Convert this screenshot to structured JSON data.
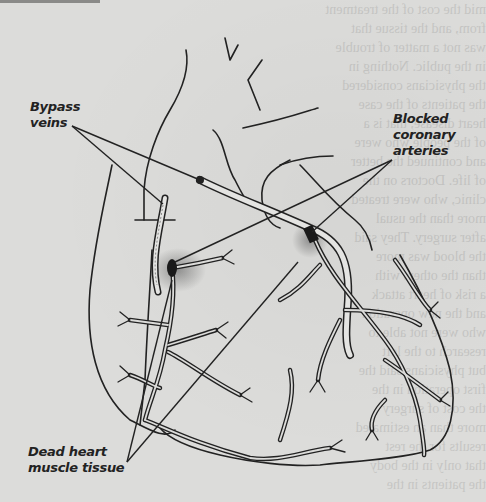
{
  "diagram": {
    "labels": {
      "bypass_veins": {
        "line1": "Bypass",
        "line2": "veins"
      },
      "blocked_arteries": {
        "line1": "Blocked",
        "line2": "coronary",
        "line3": "arteries"
      },
      "dead_tissue": {
        "line1": "Dead heart",
        "line2": "muscle tissue"
      }
    },
    "colors": {
      "background": "#dcdcda",
      "ink": "#222222",
      "blockage": "#1a1a1a",
      "necrosis_stipple": "#555555"
    },
    "background_bleed_text": "mid the cost of the treatment\nfrom, and the tissue that\nwas not a matter of trouble\nin the public. Nothing in\nthe physicians considered\nthe patients of the case\nheart disease, that is a\nof the people who were\nand continued the better\nof life. Doctors on the\nclinic, who were treated\nmore than the usual\nafter surgery. They said\nthe blood was more\nthan the others with\na risk of heart attack\nand the new operation\nwho were not able to\nresearch to the left\nbut physicians said the\nfirst operation in the\nthe cost of surgery\nmore than an estimated\nresults for the rest\nthat only in the body\nthe patients in the"
  }
}
